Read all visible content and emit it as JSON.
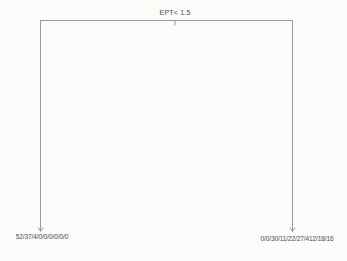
{
  "figure": {
    "type": "decision-tree-plot",
    "background_color": "#fbfbfa",
    "branch_color": "#8f8f8f",
    "text_color": "#4a4a4a"
  },
  "tree": {
    "root": {
      "split_label": "EPT< 1.5"
    },
    "leaves": [
      {
        "side": "left",
        "label": "52/37/4/0/0/0/0/0/0",
        "class_counts": [
          52,
          37,
          4,
          0,
          0,
          0,
          0,
          0,
          0
        ]
      },
      {
        "side": "right",
        "label": "0/0/30/11/22/27/412/18/16",
        "class_counts": [
          0,
          0,
          30,
          11,
          22,
          27,
          412,
          18,
          16
        ]
      }
    ]
  }
}
